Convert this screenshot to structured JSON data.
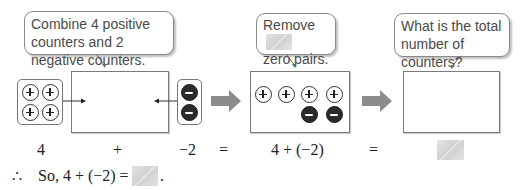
{
  "bubbles": {
    "step1": "Combine 4 positive counters and 2 negative counters.",
    "step2_line1": "Remove",
    "step2_line2": "zero pairs.",
    "step3": "What is the total number of counters?"
  },
  "counters": {
    "left_tray": {
      "positive": 4
    },
    "right_tray": {
      "negative": 2
    },
    "middle_box": {
      "positive": 4,
      "negative": 2
    }
  },
  "equation_row": {
    "term1": "4",
    "op1": "+",
    "term2": "−2",
    "eq1": "=",
    "expr": "4 + (−2)",
    "eq2": "=",
    "answer": ""
  },
  "conclusion": {
    "therefore_symbol": "∴",
    "text": "So, 4 + (−2) =",
    "period": "."
  },
  "colors": {
    "arrow_gray": "#8c8c8c",
    "blank_gray": "#d9d9d9",
    "negative_counter": "#2b2b2b"
  }
}
